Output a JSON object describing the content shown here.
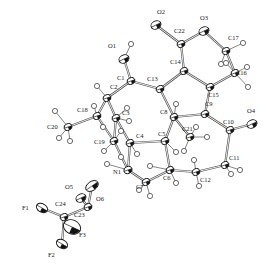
{
  "figure": {
    "type": "ORTEP thermal ellipsoid plot",
    "atoms": [
      {
        "label": "O1",
        "x": 124,
        "y": 59,
        "lx": 108,
        "ly": 48,
        "el": "O"
      },
      {
        "label": "O2",
        "x": 156,
        "y": 25,
        "lx": 157,
        "ly": 14,
        "el": "O"
      },
      {
        "label": "O3",
        "x": 204,
        "y": 31,
        "lx": 200,
        "ly": 20,
        "el": "O"
      },
      {
        "label": "O4",
        "x": 252,
        "y": 124,
        "lx": 247,
        "ly": 113,
        "el": "O"
      },
      {
        "label": "O5",
        "x": 81,
        "y": 198,
        "lx": 65,
        "ly": 189,
        "el": "O"
      },
      {
        "label": "O6",
        "x": 92,
        "y": 186,
        "lx": 96,
        "ly": 201,
        "el": "O"
      },
      {
        "label": "N1",
        "x": 128,
        "y": 170,
        "lx": 113,
        "ly": 174,
        "el": "N"
      },
      {
        "label": "C1",
        "x": 131,
        "y": 81,
        "lx": 117,
        "ly": 80,
        "el": "C"
      },
      {
        "label": "C2",
        "x": 107,
        "y": 98,
        "lx": 110,
        "ly": 89,
        "el": "C"
      },
      {
        "label": "C3",
        "x": 116,
        "y": 118,
        "lx": 122,
        "ly": 115,
        "el": "C"
      },
      {
        "label": "C4",
        "x": 130,
        "y": 143,
        "lx": 136,
        "ly": 138,
        "el": "C"
      },
      {
        "label": "C5",
        "x": 165,
        "y": 141,
        "lx": 158,
        "ly": 136,
        "el": "C"
      },
      {
        "label": "C6",
        "x": 170,
        "y": 170,
        "lx": 163,
        "ly": 180,
        "el": "C"
      },
      {
        "label": "C7",
        "x": 146,
        "y": 182,
        "lx": 136,
        "ly": 189,
        "el": "C"
      },
      {
        "label": "C8",
        "x": 174,
        "y": 117,
        "lx": 160,
        "ly": 114,
        "el": "C"
      },
      {
        "label": "C9",
        "x": 205,
        "y": 114,
        "lx": 205,
        "ly": 106,
        "el": "C"
      },
      {
        "label": "C10",
        "x": 230,
        "y": 130,
        "lx": 223,
        "ly": 124,
        "el": "C"
      },
      {
        "label": "C11",
        "x": 225,
        "y": 165,
        "lx": 229,
        "ly": 160,
        "el": "C"
      },
      {
        "label": "C12",
        "x": 196,
        "y": 172,
        "lx": 200,
        "ly": 182,
        "el": "C"
      },
      {
        "label": "C13",
        "x": 160,
        "y": 89,
        "lx": 147,
        "ly": 81,
        "el": "C"
      },
      {
        "label": "C14",
        "x": 184,
        "y": 71,
        "lx": 170,
        "ly": 64,
        "el": "C"
      },
      {
        "label": "C15",
        "x": 210,
        "y": 87,
        "lx": 208,
        "ly": 97,
        "el": "C"
      },
      {
        "label": "C16",
        "x": 235,
        "y": 73,
        "lx": 236,
        "ly": 75,
        "el": "C"
      },
      {
        "label": "C17",
        "x": 226,
        "y": 51,
        "lx": 228,
        "ly": 40,
        "el": "C"
      },
      {
        "label": "C18",
        "x": 97,
        "y": 116,
        "lx": 77,
        "ly": 112,
        "el": "C"
      },
      {
        "label": "C19",
        "x": 114,
        "y": 141,
        "lx": 94,
        "ly": 144,
        "el": "C"
      },
      {
        "label": "C20",
        "x": 68,
        "y": 127,
        "lx": 47,
        "ly": 129,
        "el": "C"
      },
      {
        "label": "C21",
        "x": 190,
        "y": 137,
        "lx": 182,
        "ly": 131,
        "el": "C"
      },
      {
        "label": "C22",
        "x": 181,
        "y": 44,
        "lx": 174,
        "ly": 33,
        "el": "C"
      },
      {
        "label": "C23",
        "x": 88,
        "y": 207,
        "lx": 74,
        "ly": 217,
        "el": "C"
      },
      {
        "label": "C24",
        "x": 64,
        "y": 217,
        "lx": 55,
        "ly": 206,
        "el": "C"
      },
      {
        "label": "F1",
        "x": 42,
        "y": 208,
        "lx": 22,
        "ly": 210,
        "el": "F"
      },
      {
        "label": "F2",
        "x": 62,
        "y": 244,
        "lx": 48,
        "ly": 257,
        "el": "F"
      },
      {
        "label": "F3",
        "x": 72,
        "y": 227,
        "lx": 79,
        "ly": 237,
        "el": "F"
      }
    ],
    "bonds": [
      [
        "O1",
        "C1"
      ],
      [
        "C1",
        "C2"
      ],
      [
        "C1",
        "C13"
      ],
      [
        "C2",
        "C3"
      ],
      [
        "C2",
        "C18"
      ],
      [
        "C3",
        "C4"
      ],
      [
        "C3",
        "C19"
      ],
      [
        "C18",
        "C20"
      ],
      [
        "C18",
        "C19"
      ],
      [
        "C19",
        "N1"
      ],
      [
        "N1",
        "C4"
      ],
      [
        "N1",
        "C7"
      ],
      [
        "C4",
        "C5"
      ],
      [
        "C5",
        "C6"
      ],
      [
        "C6",
        "C7"
      ],
      [
        "C5",
        "C8"
      ],
      [
        "C8",
        "C13"
      ],
      [
        "C8",
        "C9"
      ],
      [
        "C8",
        "C21"
      ],
      [
        "C13",
        "C14"
      ],
      [
        "C14",
        "C22"
      ],
      [
        "C14",
        "C15"
      ],
      [
        "C22",
        "O2"
      ],
      [
        "C22",
        "O3"
      ],
      [
        "O3",
        "C17"
      ],
      [
        "C17",
        "C16"
      ],
      [
        "C16",
        "C15"
      ],
      [
        "C15",
        "C9"
      ],
      [
        "C9",
        "C10"
      ],
      [
        "C10",
        "O4"
      ],
      [
        "C10",
        "C11"
      ],
      [
        "C11",
        "C12"
      ],
      [
        "C12",
        "C6"
      ],
      [
        "C23",
        "O5"
      ],
      [
        "C23",
        "O6"
      ],
      [
        "C23",
        "C24"
      ],
      [
        "C24",
        "F1"
      ],
      [
        "C24",
        "F2"
      ],
      [
        "C24",
        "F3"
      ]
    ],
    "hydrogens": [
      {
        "from": "O1",
        "x": 131,
        "y": 44
      },
      {
        "from": "C2",
        "x": 97,
        "y": 86
      },
      {
        "from": "C3",
        "x": 127,
        "y": 108
      },
      {
        "from": "C3",
        "x": 129,
        "y": 121
      },
      {
        "from": "C18",
        "x": 94,
        "y": 106
      },
      {
        "from": "C18",
        "x": 103,
        "y": 127
      },
      {
        "from": "C20",
        "x": 55,
        "y": 111
      },
      {
        "from": "C20",
        "x": 59,
        "y": 138
      },
      {
        "from": "C20",
        "x": 70,
        "y": 141
      },
      {
        "from": "C19",
        "x": 104,
        "y": 151
      },
      {
        "from": "C19",
        "x": 121,
        "y": 131
      },
      {
        "from": "N1",
        "x": 107,
        "y": 164
      },
      {
        "from": "N1",
        "x": 121,
        "y": 157
      },
      {
        "from": "C4",
        "x": 137,
        "y": 154
      },
      {
        "from": "C5",
        "x": 176,
        "y": 152
      },
      {
        "from": "C7",
        "x": 139,
        "y": 190
      },
      {
        "from": "C7",
        "x": 150,
        "y": 196
      },
      {
        "from": "C6",
        "x": 176,
        "y": 183
      },
      {
        "from": "C6",
        "x": 150,
        "y": 166
      },
      {
        "from": "C12",
        "x": 194,
        "y": 160
      },
      {
        "from": "C12",
        "x": 199,
        "y": 186
      },
      {
        "from": "C11",
        "x": 240,
        "y": 170
      },
      {
        "from": "C11",
        "x": 231,
        "y": 174
      },
      {
        "from": "C21",
        "x": 207,
        "y": 137
      },
      {
        "from": "C21",
        "x": 184,
        "y": 151
      },
      {
        "from": "C21",
        "x": 196,
        "y": 127
      },
      {
        "from": "C8",
        "x": 176,
        "y": 104
      },
      {
        "from": "C17",
        "x": 243,
        "y": 43
      },
      {
        "from": "C17",
        "x": 221,
        "y": 64
      },
      {
        "from": "C16",
        "x": 247,
        "y": 67
      },
      {
        "from": "C16",
        "x": 248,
        "y": 87
      },
      {
        "from": "C16",
        "x": 226,
        "y": 63
      }
    ]
  }
}
